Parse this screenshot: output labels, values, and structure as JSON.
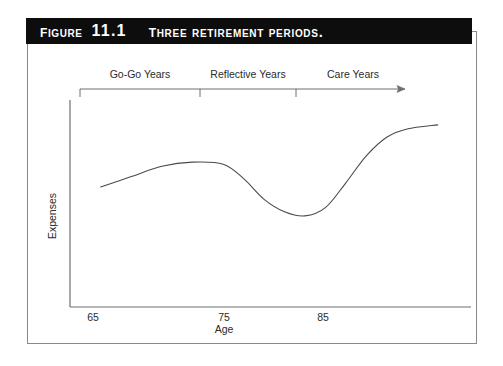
{
  "figure": {
    "label": "Figure",
    "number": "11.1",
    "caption": "Three retirement periods."
  },
  "chart_data": {
    "type": "line",
    "title": "Three retirement periods.",
    "xlabel": "Age",
    "ylabel": "Expenses",
    "xlim": [
      60,
      97
    ],
    "ylim": [
      0,
      100
    ],
    "xticks": [
      65,
      75,
      85
    ],
    "xtick_labels": [
      "65",
      "75",
      "85"
    ],
    "yticks": [],
    "ytick_labels": [],
    "grid": false,
    "legend": null,
    "series": [
      {
        "name": "Expenses",
        "x": [
          63,
          66,
          69,
          72,
          75,
          77,
          79,
          81,
          83,
          85,
          87,
          89,
          91,
          93,
          96
        ],
        "values": [
          58,
          63,
          68,
          70,
          69,
          62,
          52,
          46,
          44,
          48,
          60,
          73,
          82,
          86,
          88
        ]
      }
    ],
    "annotations": [
      {
        "name": "go-go-years",
        "label": "Go-Go Years",
        "start_age": 64,
        "end_age": 75
      },
      {
        "name": "reflective-years",
        "label": "Reflective Years",
        "start_age": 75,
        "end_age": 84
      },
      {
        "name": "care-years",
        "label": "Care Years",
        "start_age": 84,
        "end_age": 95
      }
    ]
  },
  "axis": {
    "x_label": "Age",
    "y_label": "Expenses",
    "tick_65": "65",
    "tick_75": "75",
    "tick_85": "85"
  },
  "periods": {
    "go_go": "Go-Go Years",
    "reflective": "Reflective Years",
    "care": "Care Years"
  },
  "colors": {
    "banner_background": "#0d0d0d",
    "banner_text": "#ffffff",
    "frame_border": "#8a8a8a",
    "axis_line": "#6e6e6e",
    "curve_line": "#4a4a4a",
    "label_text": "#2b2b2b",
    "page_background": "#ffffff"
  }
}
